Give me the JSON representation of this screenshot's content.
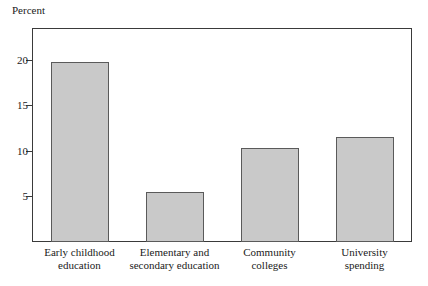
{
  "chart_data": {
    "type": "bar",
    "title": "",
    "xlabel": "",
    "ylabel": "Percent",
    "ylim": [
      0,
      23.5
    ],
    "yticks": [
      5,
      10,
      15,
      20
    ],
    "ytick_labels": [
      "5",
      "10",
      "15",
      "20"
    ],
    "grid": false,
    "legend": null,
    "categories": [
      "Early childhood\neducation",
      "Elementary and\nsecondary education",
      "Community\ncolleges",
      "University\nspending"
    ],
    "values": [
      19.8,
      5.5,
      10.3,
      11.5
    ],
    "bar_color": "#c9c9c9",
    "bar_edge_color": "#5a5a5a",
    "axis_color": "#3a3a3a"
  }
}
